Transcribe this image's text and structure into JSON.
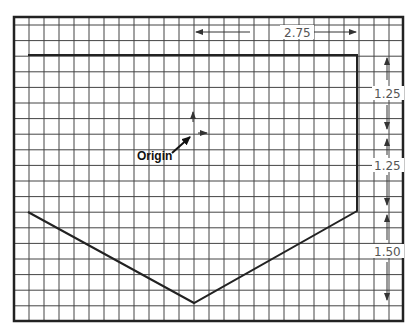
{
  "diagram": {
    "type": "sketch-on-grid",
    "frame": {
      "x": 14,
      "y": 17,
      "width": 389,
      "height": 304
    },
    "grid": {
      "cols": 26,
      "rows": 19,
      "line_color": "#444444"
    },
    "shape": {
      "description": "Pentagon profile (rectangle with V-shaped bottom)",
      "points": [
        [
          28,
          55
        ],
        [
          357,
          55
        ],
        [
          357,
          211
        ],
        [
          194,
          303
        ],
        [
          28,
          212
        ]
      ],
      "stroke": "#222222"
    },
    "origin": {
      "label": "Origin",
      "point": [
        193,
        133
      ]
    },
    "dimensions": {
      "horizontal": {
        "label": "2.75",
        "from_x": 195,
        "to_x": 357,
        "y": 32
      },
      "vertical": [
        {
          "label": "1.25",
          "from_y": 57,
          "to_y": 129
        },
        {
          "label": "1.25",
          "from_y": 139,
          "to_y": 205
        },
        {
          "label": "1.50",
          "from_y": 215,
          "to_y": 300
        }
      ],
      "vertical_x": 387
    }
  }
}
